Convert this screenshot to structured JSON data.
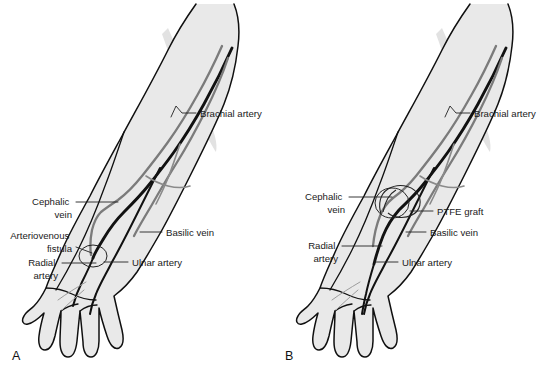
{
  "figure": {
    "background_color": "#ffffff",
    "width": 551,
    "height": 371
  },
  "colors": {
    "skin_fill": "#e9e9e9",
    "outline": "#101010",
    "artery": "#111111",
    "vein": "#7b7b7b",
    "label_text": "#1a1a1a",
    "leader_line": "#222222"
  },
  "panels": [
    {
      "id": "panel-a",
      "letter": "A",
      "letter_position": {
        "x": 12,
        "y": 360
      },
      "description": "Forearm with native arteriovenous fistula",
      "labels": [
        {
          "name": "brachial-artery",
          "lines": [
            "Brachial artery"
          ],
          "text_x": 200,
          "text_y": 117,
          "align": "start",
          "leader": "M196,113 L182,113 L176,106 L171,117"
        },
        {
          "name": "cephalic-vein",
          "lines": [
            "Cephalic",
            "vein"
          ],
          "text_x": 72,
          "text_y": 205,
          "align": "end",
          "leader": "M76,202 L118,202"
        },
        {
          "name": "basilic-vein",
          "lines": [
            "Basilic vein"
          ],
          "text_x": 166,
          "text_y": 236,
          "align": "start",
          "leader": "M162,232 L140,232"
        },
        {
          "name": "arteriovenous-fistula",
          "lines": [
            "Arteriovenous",
            "fistula"
          ],
          "text_x": 72,
          "text_y": 239,
          "align": "end",
          "leader": "M76,247 L92,253"
        },
        {
          "name": "ulnar-artery",
          "lines": [
            "Ulnar artery"
          ],
          "text_x": 132,
          "text_y": 266,
          "align": "start",
          "leader": "M128,262 L104,262"
        },
        {
          "name": "radial-artery",
          "lines": [
            "Radial",
            "artery"
          ],
          "text_x": 58,
          "text_y": 266,
          "align": "end",
          "leader": "M62,263 L96,263"
        }
      ],
      "callout": {
        "name": "fistula-callout-circle",
        "cx": 93,
        "cy": 256,
        "rx": 14,
        "ry": 11
      }
    },
    {
      "id": "panel-b",
      "letter": "B",
      "letter_position": {
        "x": 285,
        "y": 360
      },
      "description": "Forearm with PTFE graft between artery and vein",
      "labels": [
        {
          "name": "brachial-artery",
          "lines": [
            "Brachial artery"
          ],
          "text_x": 474,
          "text_y": 117,
          "align": "start",
          "leader": "M470,113 L456,113 L450,106 L445,117"
        },
        {
          "name": "cephalic-vein",
          "lines": [
            "Cephalic",
            "vein"
          ],
          "text_x": 345,
          "text_y": 200,
          "align": "end",
          "leader": "M349,197 L392,197"
        },
        {
          "name": "ptfe-graft",
          "lines": [
            "PTFE graft"
          ],
          "text_x": 437,
          "text_y": 215,
          "align": "start",
          "leader": "M433,211 L410,211"
        },
        {
          "name": "basilic-vein",
          "lines": [
            "Basilic vein"
          ],
          "text_x": 430,
          "text_y": 236,
          "align": "start",
          "leader": "M426,232 L406,232"
        },
        {
          "name": "radial-artery",
          "lines": [
            "Radial",
            "artery"
          ],
          "text_x": 338,
          "text_y": 249,
          "align": "end",
          "leader": "M342,246 L382,246"
        },
        {
          "name": "ulnar-artery",
          "lines": [
            "Ulnar artery"
          ],
          "text_x": 402,
          "text_y": 266,
          "align": "start",
          "leader": "M398,262 L375,262"
        }
      ],
      "callout": {
        "name": "graft-callout-circle",
        "cx": 392,
        "cy": 203,
        "rx": 17,
        "ry": 15
      }
    }
  ]
}
